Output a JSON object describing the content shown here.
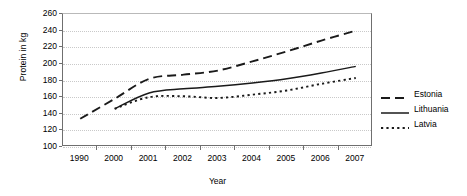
{
  "chart_data": {
    "type": "line",
    "title": "",
    "xlabel": "Year",
    "ylabel": "Protein in kg",
    "categories": [
      "1990",
      "2000",
      "2001",
      "2002",
      "2003",
      "2004",
      "2005",
      "2006",
      "2007"
    ],
    "ylim": [
      100,
      260
    ],
    "yticks": [
      100,
      120,
      140,
      160,
      180,
      200,
      220,
      240,
      260
    ],
    "grid": true,
    "legend_position": "right",
    "series": [
      {
        "name": "Estonia",
        "style": "dashed",
        "values": [
          134,
          158,
          182,
          187,
          192,
          203,
          215,
          228,
          240
        ]
      },
      {
        "name": "Lithuania",
        "style": "solid",
        "values": [
          null,
          146,
          165,
          170,
          173,
          177,
          182,
          189,
          197
        ]
      },
      {
        "name": "Latvia",
        "style": "dotted",
        "values": [
          null,
          146,
          160,
          161,
          159,
          163,
          168,
          176,
          183
        ]
      }
    ]
  },
  "axis": {
    "y_title": "Protein in kg",
    "x_title": "Year",
    "y_tick_labels": [
      "260",
      "240",
      "220",
      "200",
      "180",
      "160",
      "140",
      "120",
      "100"
    ],
    "x_tick_labels": [
      "1990",
      "2000",
      "2001",
      "2002",
      "2003",
      "2004",
      "2005",
      "2006",
      "2007"
    ]
  },
  "legend": {
    "items": [
      {
        "label": "Estonia",
        "style": "dashed"
      },
      {
        "label": "Lithuania",
        "style": "solid"
      },
      {
        "label": "Latvia",
        "style": "dotted"
      }
    ]
  },
  "colors": {
    "series": "#1a1a1a",
    "grid": "#c9c9c9",
    "axis": "#6f6f6f",
    "background": "#ffffff"
  }
}
